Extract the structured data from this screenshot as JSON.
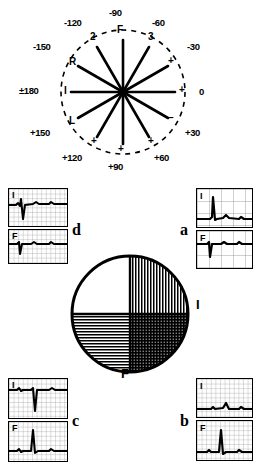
{
  "figure": {
    "ink_color": "#000000",
    "background": "#ffffff"
  },
  "hexaxial": {
    "name": "hexaxial-reference-diagram",
    "degree_labels": [
      {
        "text": "-90",
        "x": 118,
        "y": 14,
        "angle_deg": -90
      },
      {
        "text": "-120",
        "x": 79,
        "y": 23,
        "angle_deg": -120
      },
      {
        "text": "-60",
        "x": 155,
        "y": 23,
        "angle_deg": -60
      },
      {
        "text": "-150",
        "x": 46,
        "y": 48,
        "angle_deg": -150
      },
      {
        "text": "-30",
        "x": 184,
        "y": 48,
        "angle_deg": -30
      },
      {
        "text": "0",
        "x": 196,
        "y": 92,
        "angle_deg": 0
      },
      {
        "text": "+150",
        "x": 40,
        "y": 131,
        "angle_deg": 150
      },
      {
        "text": "+30",
        "x": 182,
        "y": 131,
        "angle_deg": 30
      },
      {
        "text": "+120",
        "x": 76,
        "y": 158,
        "angle_deg": 120
      },
      {
        "text": "+60",
        "x": 152,
        "y": 158,
        "angle_deg": 60
      },
      {
        "text": "+90",
        "x": 113,
        "y": 166,
        "angle_deg": 90
      }
    ],
    "pm180_label": {
      "text": "180",
      "sign": "±",
      "x": 26,
      "y": 90
    },
    "lead_labels": [
      {
        "text": "F",
        "x": 120,
        "y": 30,
        "lead": "aVF-axis"
      },
      {
        "text": "2",
        "x": 94,
        "y": 37,
        "lead": "II-axis"
      },
      {
        "text": "3",
        "x": 151,
        "y": 37,
        "lead": "III-axis"
      },
      {
        "text": "R",
        "x": 72,
        "y": 62,
        "lead": "aVR-axis"
      },
      {
        "text": "L",
        "x": 72,
        "y": 121,
        "lead": "aVL-axis"
      },
      {
        "text": "I",
        "x": 66,
        "y": 89,
        "lead": "I-axis"
      }
    ],
    "polarity_marks": [
      {
        "text": "+",
        "x": 171,
        "y": 62
      },
      {
        "text": "+",
        "x": 182,
        "y": 90
      },
      {
        "text": "–",
        "x": 171,
        "y": 119
      },
      {
        "text": "+",
        "x": 151,
        "y": 142
      },
      {
        "text": "+",
        "x": 94,
        "y": 142
      },
      {
        "text": "+",
        "x": 121,
        "y": 150
      }
    ],
    "spoke_count": 12,
    "center": {
      "x": 123,
      "y": 92
    },
    "radius": 62,
    "dashed_circle": true
  },
  "quadrant_circle": {
    "name": "qrs-axis-quadrant-circle",
    "labels": [
      {
        "text": "I",
        "x": 197,
        "y": 305,
        "position": "right"
      },
      {
        "text": "F",
        "x": 124,
        "y": 374,
        "position": "bottom"
      }
    ],
    "quadrants": [
      {
        "name": "upper-left",
        "fill": "blank",
        "axis_range": "0 to -90 (left/upward)"
      },
      {
        "name": "upper-right",
        "fill": "vertical",
        "axis_range": "0 to -90"
      },
      {
        "name": "lower-left",
        "fill": "horizontal",
        "axis_range": "+90 to +180"
      },
      {
        "name": "lower-right",
        "fill": "crosshatch",
        "axis_range": "0 to +90 (normal)"
      }
    ]
  },
  "ecg_panels": [
    {
      "id": "d",
      "letter": "d",
      "name": "ecg-panel-d",
      "position": "top-left",
      "strips": [
        {
          "lead": "I",
          "label": "I",
          "qrs": "negative"
        },
        {
          "lead": "F",
          "label": "F",
          "qrs": "negative"
        }
      ]
    },
    {
      "id": "a",
      "letter": "a",
      "name": "ecg-panel-a",
      "position": "top-right",
      "strips": [
        {
          "lead": "I",
          "label": "I",
          "qrs": "positive"
        },
        {
          "lead": "F",
          "label": "F",
          "qrs": "negative"
        }
      ]
    },
    {
      "id": "c",
      "letter": "c",
      "name": "ecg-panel-c",
      "position": "bottom-left",
      "strips": [
        {
          "lead": "I",
          "label": "I",
          "qrs": "negative"
        },
        {
          "lead": "F",
          "label": "F",
          "qrs": "positive"
        }
      ]
    },
    {
      "id": "b",
      "letter": "b",
      "name": "ecg-panel-b",
      "position": "bottom-right",
      "strips": [
        {
          "lead": "I",
          "label": "I",
          "qrs": "positive"
        },
        {
          "lead": "F",
          "label": "F",
          "qrs": "positive"
        }
      ]
    }
  ]
}
